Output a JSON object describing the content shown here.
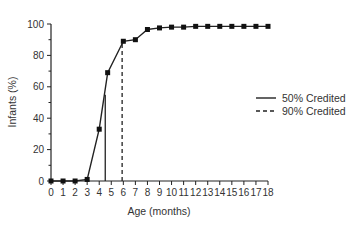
{
  "chart_data": {
    "type": "line",
    "title": "",
    "xlabel": "Age  (months)",
    "ylabel": "Infants  (%)",
    "xlim": [
      0,
      18
    ],
    "ylim": [
      0,
      100
    ],
    "x_ticks": [
      0,
      1,
      2,
      3,
      4,
      5,
      6,
      7,
      8,
      9,
      10,
      11,
      12,
      13,
      14,
      15,
      16,
      17,
      18
    ],
    "y_ticks": [
      0,
      20,
      40,
      60,
      80,
      100
    ],
    "grid": false,
    "legend_position": "right",
    "series": [
      {
        "name": "Infants credited",
        "x": [
          0,
          1,
          2,
          3,
          4,
          4.7,
          6,
          7,
          8,
          9,
          10,
          11,
          12,
          13,
          14,
          15,
          16,
          17,
          18
        ],
        "values": [
          0,
          0,
          0,
          1,
          33,
          69,
          89,
          90,
          96.5,
          97.5,
          98,
          98,
          98.5,
          98.5,
          98.5,
          98.5,
          98.5,
          98.5,
          98.5
        ],
        "marker": "square"
      }
    ],
    "reference_lines": [
      {
        "name": "50% Credited",
        "x": 4.5,
        "y_top": 55,
        "style": "solid"
      },
      {
        "name": "90% Credited",
        "x": 5.9,
        "y_top": 89,
        "style": "dashed"
      }
    ],
    "legend": [
      {
        "label": "50% Credited",
        "style": "solid"
      },
      {
        "label": "90% Credited",
        "style": "dashed"
      }
    ]
  }
}
